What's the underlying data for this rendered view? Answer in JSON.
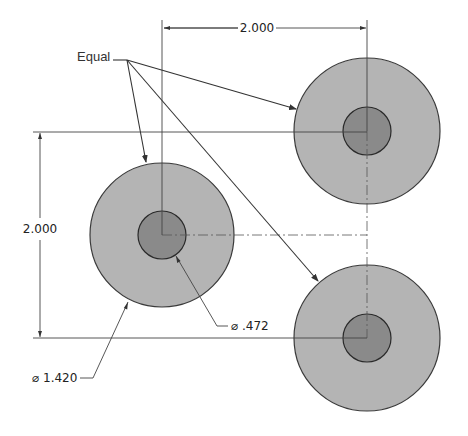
{
  "drawing": {
    "title": "Three-hole pattern sketch with equal relation",
    "colors": {
      "background": "#ffffff",
      "outer_fill": "#b4b4b4",
      "inner_fill": "#8a8a8a",
      "line": "#444444"
    },
    "circles": [
      {
        "id": "left",
        "cx": 162,
        "cy": 235,
        "outer_r": 72,
        "inner_r": 24
      },
      {
        "id": "top-right",
        "cx": 367,
        "cy": 131,
        "outer_r": 73,
        "inner_r": 24
      },
      {
        "id": "bottom-right",
        "cx": 367,
        "cy": 338,
        "outer_r": 73,
        "inner_r": 24
      }
    ],
    "annotations": {
      "equal_label": "Equal",
      "horizontal_dim": "2.000",
      "vertical_dim": "2.000",
      "inner_diameter": "⌀ .472",
      "outer_diameter": "⌀ 1.420"
    }
  }
}
